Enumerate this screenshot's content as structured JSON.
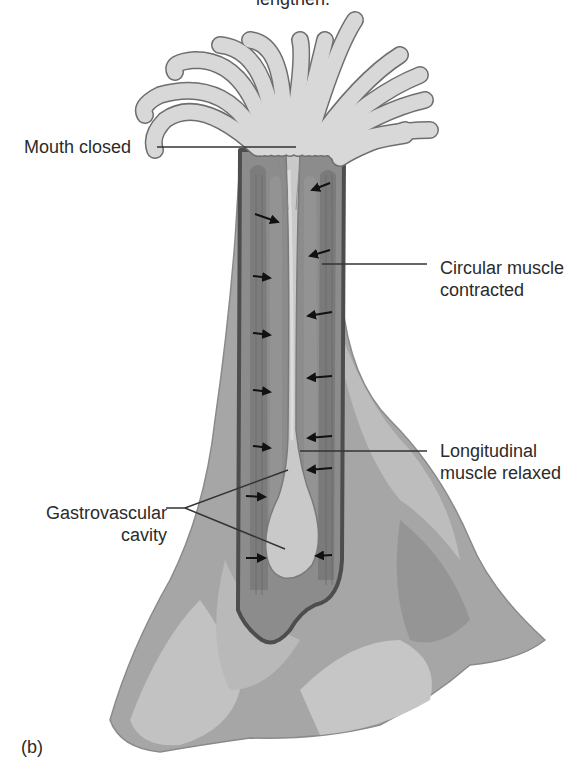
{
  "figure": {
    "caption_top_fragment": "lengthen.",
    "panel_label": "(b)",
    "colors": {
      "tentacle_fill": "#d6d6d6",
      "tentacle_outline": "#6e6e6e",
      "body_outer": "#a9a9a9",
      "body_mid": "#8f8f8f",
      "body_light": "#c4c4c4",
      "muscle_band": "#747474",
      "wall_outline": "#4a4a4a",
      "cavity_fill": "#c9c9c9",
      "arrow": "#111111",
      "leader_line": "#333333",
      "text": "#2b2b2b"
    }
  },
  "labels": {
    "mouth": "Mouth closed",
    "circular_line1": "Circular muscle",
    "circular_line2": "contracted",
    "longitudinal_line1": "Longitudinal",
    "longitudinal_line2": "muscle relaxed",
    "gastro_line1": "Gastrovascular",
    "gastro_line2": "cavity"
  },
  "arrows": {
    "left_column_direction": "inward-right",
    "right_column_direction": "inward-left",
    "left_count": 7,
    "right_count": 7
  }
}
